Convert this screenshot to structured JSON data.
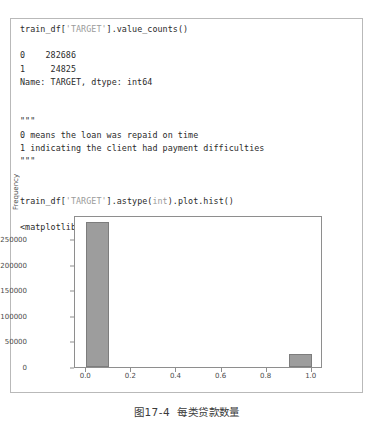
{
  "code_cell": {
    "lines": [
      {
        "id": "l1",
        "segments": [
          {
            "t": "train_df[",
            "s": "plain"
          },
          {
            "t": "'TARGET'",
            "s": "str"
          },
          {
            "t": "].value_counts()",
            "s": "plain"
          }
        ]
      },
      {
        "id": "blank1",
        "blank": true
      },
      {
        "id": "l2",
        "segments": [
          {
            "t": "0    282686",
            "s": "plain"
          }
        ]
      },
      {
        "id": "l3",
        "segments": [
          {
            "t": "1     24825",
            "s": "plain"
          }
        ]
      },
      {
        "id": "l4",
        "segments": [
          {
            "t": "Name: TARGET, dtype: int64",
            "s": "plain"
          }
        ]
      },
      {
        "id": "blank2",
        "blank": true
      },
      {
        "id": "blank3",
        "blank": true
      },
      {
        "id": "l5",
        "segments": [
          {
            "t": "\"\"\"",
            "s": "plain"
          }
        ]
      },
      {
        "id": "l6",
        "segments": [
          {
            "t": "0 means the loan was repaid on time",
            "s": "plain"
          }
        ]
      },
      {
        "id": "l7",
        "segments": [
          {
            "t": "1 indicating the client had payment difficulties",
            "s": "plain"
          }
        ]
      },
      {
        "id": "l8",
        "segments": [
          {
            "t": "\"\"\"",
            "s": "plain"
          }
        ]
      },
      {
        "id": "blank4",
        "blank": true
      },
      {
        "id": "blank5",
        "blank": true
      },
      {
        "id": "l9",
        "segments": [
          {
            "t": "train_df[",
            "s": "plain"
          },
          {
            "t": "'TARGET'",
            "s": "str"
          },
          {
            "t": "].astype(",
            "s": "plain"
          },
          {
            "t": "int",
            "s": "kw"
          },
          {
            "t": ").plot.hist()",
            "s": "plain"
          }
        ]
      },
      {
        "id": "blank6",
        "blank": true
      },
      {
        "id": "l10",
        "segments": [
          {
            "t": "<matplotlib.axes._subplots.AxesSubplot at 0x14ee2ebfc50>",
            "s": "plain"
          }
        ]
      }
    ]
  },
  "caption": {
    "text": "图17-4  每类贷款数量"
  },
  "colors": {
    "bar_fill": "#9d9d9d",
    "bar_edge": "#7d7d7d",
    "axis": "#8e8e8e",
    "frame_border": "#b9b9b9",
    "text": "#2b2b2b",
    "muted_text": "#9b9b9b"
  },
  "chart_data": {
    "type": "bar",
    "title": "",
    "xlabel": "",
    "ylabel": "Frequency",
    "categories": [
      "0",
      "1"
    ],
    "values": [
      282686,
      24825
    ],
    "bar_left_edges": [
      0.0,
      0.9
    ],
    "bar_width": 0.1,
    "xlim": [
      -0.05,
      1.05
    ],
    "ylim": [
      0,
      297000
    ],
    "xticks": [
      0.0,
      0.2,
      0.4,
      0.6,
      0.8,
      1.0
    ],
    "xticklabels": [
      "0.0",
      "0.2",
      "0.4",
      "0.6",
      "0.8",
      "1.0"
    ],
    "yticks": [
      0,
      50000,
      100000,
      150000,
      200000,
      250000
    ],
    "yticklabels": [
      "0",
      "50000",
      "100000",
      "150000",
      "200000",
      "250000"
    ],
    "grid": false,
    "legend": false
  }
}
